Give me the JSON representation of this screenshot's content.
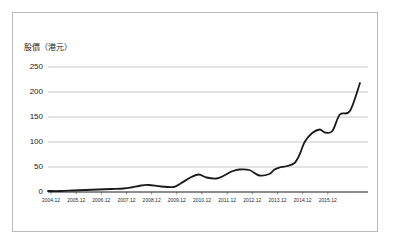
{
  "figure": {
    "border_color": "#b9b9b9",
    "background": "#ffffff"
  },
  "chart_data": {
    "type": "line",
    "title": "",
    "subtitle": "",
    "ylabel": "股價（港元）",
    "xlabel": "",
    "ylim": [
      0,
      250
    ],
    "yticks": [
      0,
      50,
      100,
      150,
      200,
      250
    ],
    "grid": true,
    "grid_axis": "y",
    "grid_color": "#b0b0b0",
    "legend": false,
    "legend_position": "none",
    "line_color": "#1a1a1a",
    "line_width": 1.8,
    "xticks": [
      "2004.12",
      "2005.12",
      "2006.12",
      "2007.12",
      "2008.12",
      "2009.12",
      "2010.12",
      "2011.12",
      "2012.12",
      "2013.12",
      "2014.12",
      "2015.12"
    ],
    "x": [
      2004.0,
      2004.5,
      2005.0,
      2005.5,
      2006.0,
      2006.5,
      2007.0,
      2007.3,
      2007.7,
      2008.0,
      2008.5,
      2009.0,
      2009.3,
      2009.7,
      2010.0,
      2010.3,
      2010.7,
      2011.0,
      2011.3,
      2011.6,
      2012.0,
      2012.4,
      2012.8,
      2013.0,
      2013.2,
      2013.5,
      2013.8,
      2014.0,
      2014.2,
      2014.5,
      2014.8,
      2015.0,
      2015.3,
      2015.6,
      2016.0,
      2016.4
    ],
    "values": [
      2,
      2,
      3,
      4,
      5,
      6,
      7,
      9,
      13,
      14,
      11,
      10,
      18,
      30,
      35,
      29,
      27,
      33,
      41,
      45,
      44,
      33,
      36,
      45,
      49,
      52,
      58,
      75,
      100,
      118,
      125,
      119,
      122,
      155,
      162,
      218
    ],
    "annotations": []
  }
}
